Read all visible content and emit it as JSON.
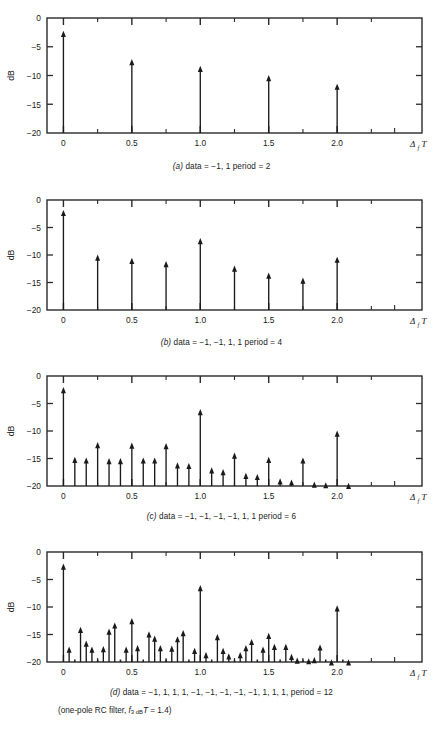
{
  "figure": {
    "axis": {
      "ylabel": "dB",
      "xlabel_delta": "Δ",
      "xlabel_sub": "f",
      "xlabel_T": "T",
      "yticks": [
        "0",
        "−5",
        "−10",
        "−15",
        "−20"
      ],
      "ytick_values": [
        0,
        -5,
        -10,
        -15,
        -20
      ],
      "xticks": [
        "0",
        "0.5",
        "1.0",
        "1.5",
        "2.0"
      ],
      "xtick_values": [
        0,
        0.5,
        1.0,
        1.5,
        2.0
      ],
      "xlim": [
        -0.12,
        2.62
      ],
      "ylim": [
        -20,
        0
      ],
      "minor_xticks": [
        0.25,
        0.75,
        1.25,
        1.75,
        2.25
      ],
      "grid": false
    },
    "colors": {
      "ink": "#1a1a1a",
      "frame": "#2a2a2a",
      "background": "#ffffff"
    },
    "footnote": {
      "text_pre": "(one-pole RC filter, ",
      "sym_f": "f",
      "sym_sub": "3 dB",
      "sym_T": "T",
      "text_post": " = 1.4)",
      "full": "(one-pole RC filter, f3 dB T = 1.4)"
    }
  },
  "chart_data": [
    {
      "id": "panel-a",
      "type": "bar",
      "title": "(a) data = −1, 1  period = 2",
      "caption_letter": "(a)",
      "caption_body": "data = −1, 1  period = 2",
      "data_pattern": [
        -1,
        1
      ],
      "period": 2,
      "xlabel": "Δf T",
      "ylabel": "dB",
      "ylim": [
        -20,
        0
      ],
      "xlim": [
        -0.12,
        2.62
      ],
      "spacing": 0.5,
      "x": [
        0,
        0.5,
        1.0,
        1.5,
        2.0
      ],
      "values": [
        -2.6,
        -7.5,
        -8.7,
        -10.3,
        -11.8
      ]
    },
    {
      "id": "panel-b",
      "type": "bar",
      "title": "(b) data = −1, −1, 1, 1  period = 4",
      "caption_letter": "(b)",
      "caption_body": "data = −1, −1, 1, 1  period = 4",
      "data_pattern": [
        -1,
        -1,
        1,
        1
      ],
      "period": 4,
      "xlabel": "Δf T",
      "ylabel": "dB",
      "ylim": [
        -20,
        0
      ],
      "xlim": [
        -0.12,
        2.62
      ],
      "spacing": 0.25,
      "x": [
        0,
        0.25,
        0.5,
        0.75,
        1.0,
        1.25,
        1.5,
        1.75,
        2.0
      ],
      "values": [
        -2.2,
        -10.3,
        -10.9,
        -11.5,
        -7.3,
        -12.3,
        -13.6,
        -14.5,
        -10.7
      ]
    },
    {
      "id": "panel-c",
      "type": "bar",
      "title": "(c) data = −1, −1, −1, −1, 1, 1  period = 6",
      "caption_letter": "(c)",
      "caption_body": "data = −1, −1, −1, −1, 1, 1  period = 6",
      "data_pattern": [
        -1,
        -1,
        -1,
        -1,
        1,
        1
      ],
      "period": 6,
      "xlabel": "Δf T",
      "ylabel": "dB",
      "ylim": [
        -20,
        0
      ],
      "xlim": [
        -0.12,
        2.62
      ],
      "spacing": 0.0833,
      "x": [
        0,
        0.0833,
        0.1667,
        0.25,
        0.3333,
        0.4167,
        0.5,
        0.5833,
        0.6667,
        0.75,
        0.8333,
        0.9167,
        1.0,
        1.0833,
        1.1667,
        1.25,
        1.3333,
        1.4167,
        1.5,
        1.5833,
        1.6667,
        1.75,
        1.8333,
        1.9167,
        2.0,
        2.0833
      ],
      "values": [
        -2.4,
        -15.1,
        -15.2,
        -12.4,
        -15.3,
        -15.3,
        -12.5,
        -15.2,
        -15.2,
        -12.6,
        -16.1,
        -16.2,
        -6.4,
        -17.0,
        -17.3,
        -14.3,
        -18.0,
        -18.2,
        -15.1,
        -19.0,
        -19.2,
        -15.2,
        -19.6,
        -19.7,
        -10.3,
        -19.8
      ]
    },
    {
      "id": "panel-d",
      "type": "bar",
      "title": "(d) data = −1, 1, 1, 1, −1, −1, −1, −1, −1, 1, 1, 1,  period = 12",
      "caption_letter": "(d)",
      "caption_body": "data = −1, 1, 1, 1, −1, −1, −1, −1, −1, 1, 1, 1,  period = 12",
      "data_pattern": [
        -1,
        1,
        1,
        1,
        -1,
        -1,
        -1,
        -1,
        -1,
        1,
        1,
        1
      ],
      "period": 12,
      "xlabel": "Δf T",
      "ylabel": "dB",
      "ylim": [
        -20,
        0
      ],
      "xlim": [
        -0.12,
        2.62
      ],
      "spacing": 0.04167,
      "x": [
        0,
        0.0417,
        0.0833,
        0.125,
        0.1667,
        0.2083,
        0.25,
        0.2917,
        0.3333,
        0.375,
        0.4167,
        0.4583,
        0.5,
        0.5417,
        0.5833,
        0.625,
        0.6667,
        0.7083,
        0.75,
        0.7917,
        0.8333,
        0.875,
        0.9167,
        0.9583,
        1.0,
        1.0417,
        1.0833,
        1.125,
        1.1667,
        1.2083,
        1.25,
        1.2917,
        1.3333,
        1.375,
        1.4167,
        1.4583,
        1.5,
        1.5417,
        1.5833,
        1.625,
        1.6667,
        1.7083,
        1.75,
        1.7917,
        1.8333,
        1.875,
        1.9167,
        1.9583,
        2.0,
        2.0417,
        2.0833
      ],
      "values": [
        -2.5,
        -17.6,
        -20.0,
        -14.0,
        -16.5,
        -17.6,
        -20.0,
        -17.5,
        -14.3,
        -13.2,
        -20.0,
        -17.6,
        -12.4,
        -17.3,
        -20.0,
        -14.8,
        -15.6,
        -17.3,
        -20.0,
        -17.4,
        -15.7,
        -14.6,
        -20.0,
        -17.8,
        -6.4,
        -18.6,
        -20.0,
        -15.3,
        -17.8,
        -18.8,
        -20.0,
        -18.6,
        -17.3,
        -16.2,
        -20.0,
        -17.6,
        -15.1,
        -17.1,
        -20.0,
        -17.1,
        -18.9,
        -19.6,
        -20.0,
        -19.7,
        -19.5,
        -17.2,
        -20.0,
        -19.9,
        -10.1,
        -20.0,
        -19.9
      ]
    }
  ]
}
